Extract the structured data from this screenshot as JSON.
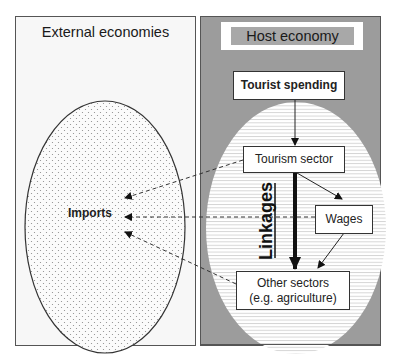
{
  "external": {
    "title": "External economies",
    "imports_label": "Imports"
  },
  "host": {
    "title": "Host economy",
    "tourist_spending": "Tourist spending",
    "tourism_sector": "Tourism sector",
    "wages": "Wages",
    "other_sectors_line1": "Other sectors",
    "other_sectors_line2": "(e.g. agriculture)",
    "linkages": "Linkages"
  },
  "colors": {
    "host_fill": "#9c9c9c",
    "host_title_fill": "#a8a8a8",
    "external_fill": "#f7f7f7",
    "stripe": "#cfcfcf",
    "dots": "#8a8a8a",
    "line": "#222222"
  }
}
